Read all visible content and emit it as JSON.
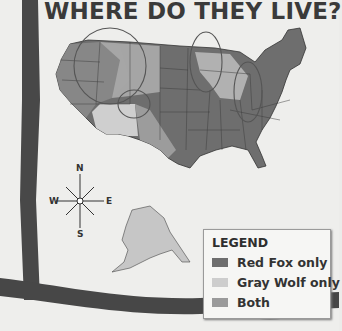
{
  "title": "WHERE DO THEY LIVE?",
  "map": {
    "region": "United States",
    "insets": [
      "Alaska"
    ],
    "colors": {
      "red_fox_only": "#6e6e6e",
      "gray_wolf_only": "#c9c9c9",
      "both": "#9c9c9c"
    }
  },
  "compass": {
    "north": "N",
    "south": "S",
    "east": "E",
    "west": "W"
  },
  "legend": {
    "title": "LEGEND",
    "items": [
      {
        "label": "Red Fox only",
        "color": "#6e6e6e"
      },
      {
        "label": "Gray Wolf only",
        "color": "#cdcdcd"
      },
      {
        "label": "Both",
        "color": "#9a9a9a"
      }
    ]
  }
}
